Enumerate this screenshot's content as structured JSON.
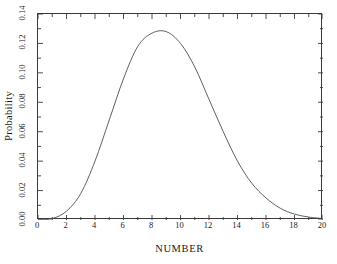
{
  "chart_data": {
    "type": "line",
    "title": "",
    "subtitle": "",
    "xlabel": "NUMBER",
    "ylabel": "Probability",
    "xlim": [
      0,
      20
    ],
    "ylim": [
      0.0,
      0.14
    ],
    "grid": false,
    "legend": null,
    "legend_position": "none",
    "x_major_step": 2,
    "x_minor_step": 1,
    "y_major_step": 0.02,
    "y_minor_step": 0.01,
    "xticks": [
      "0",
      "2",
      "4",
      "6",
      "8",
      "10",
      "12",
      "14",
      "16",
      "18",
      "20"
    ],
    "xtick_values": [
      0,
      2,
      4,
      6,
      8,
      10,
      12,
      14,
      16,
      18,
      20
    ],
    "yticks": [
      "0.00",
      "0.02",
      "0.04",
      "0.06",
      "0.08",
      "0.10",
      "0.12",
      "0.14"
    ],
    "ytick_values": [
      0.0,
      0.02,
      0.04,
      0.06,
      0.08,
      0.1,
      0.12,
      0.14
    ],
    "line_color": "#4d4d4d",
    "frame_color": "#3a3a3a",
    "background_color": "#ffffff",
    "x": [
      0,
      1,
      2,
      3,
      4,
      5,
      6,
      7,
      8,
      9,
      10,
      11,
      12,
      13,
      14,
      15,
      16,
      17,
      18,
      19,
      20
    ],
    "values": [
      0.0,
      0.001,
      0.006,
      0.018,
      0.04,
      0.068,
      0.096,
      0.118,
      0.127,
      0.128,
      0.12,
      0.104,
      0.082,
      0.06,
      0.04,
      0.025,
      0.015,
      0.008,
      0.004,
      0.002,
      0.001
    ],
    "series": [
      {
        "name": "Probability",
        "values": [
          0.0,
          0.001,
          0.006,
          0.018,
          0.04,
          0.068,
          0.096,
          0.118,
          0.127,
          0.128,
          0.12,
          0.104,
          0.082,
          0.06,
          0.04,
          0.025,
          0.015,
          0.008,
          0.004,
          0.002,
          0.001
        ]
      }
    ],
    "peak": {
      "x": 9,
      "y": 0.128
    }
  }
}
